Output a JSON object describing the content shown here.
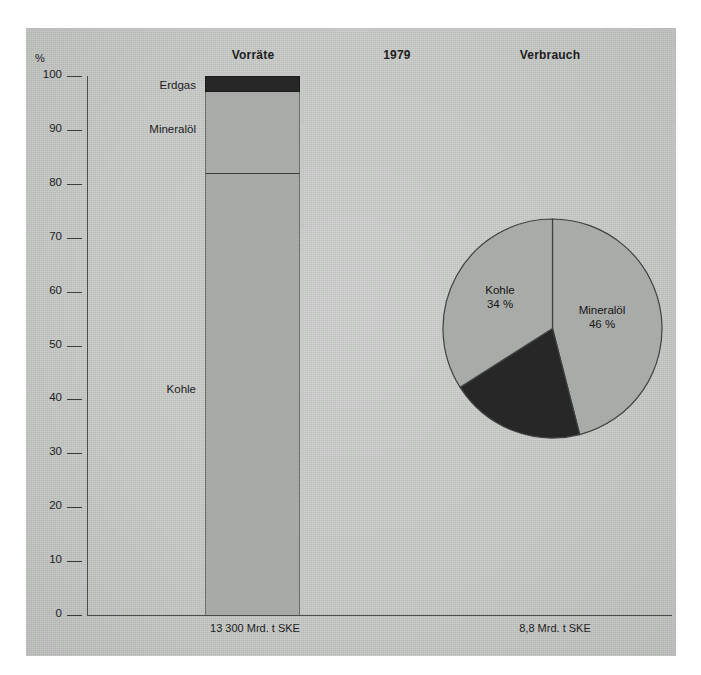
{
  "headers": {
    "reserves": "Vorräte",
    "year": "1979",
    "consumption": "Verbrauch"
  },
  "axis": {
    "unit": "%",
    "ticks": [
      {
        "value": 100,
        "label": "100"
      },
      {
        "value": 90,
        "label": "90"
      },
      {
        "value": 80,
        "label": "80"
      },
      {
        "value": 70,
        "label": "70"
      },
      {
        "value": 60,
        "label": "60"
      },
      {
        "value": 50,
        "label": "50"
      },
      {
        "value": 40,
        "label": "40"
      },
      {
        "value": 30,
        "label": "30"
      },
      {
        "value": 20,
        "label": "20"
      },
      {
        "value": 10,
        "label": "10"
      },
      {
        "value": 0,
        "label": "0"
      }
    ]
  },
  "bar_labels": {
    "erdgas": "Erdgas",
    "mineraloel": "Mineralöl",
    "kohle": "Kohle"
  },
  "pie_labels": {
    "kohle_name": "Kohle",
    "kohle_value": "34 %",
    "mineraloel_name": "Mineralöl",
    "mineraloel_value": "46 %"
  },
  "footnotes": {
    "reserves_total": "13 300 Mrd. t SKE",
    "consumption_total": "8,8 Mrd. t SKE"
  },
  "colors": {
    "panel": "#c9cbc9",
    "light_fill": "#a9aba9",
    "dark_fill": "#272727",
    "outline": "#4a4c4c",
    "text": "#1d1d1d"
  },
  "chart_data": [
    {
      "type": "bar",
      "title": "Vorräte",
      "subtitle": "13 300 Mrd. t SKE",
      "stacked": true,
      "categories": [
        "Vorräte 1979"
      ],
      "series": [
        {
          "name": "Kohle",
          "values": [
            82
          ],
          "color": "#a9aba9"
        },
        {
          "name": "Mineralöl",
          "values": [
            15
          ],
          "color": "#a9aba9"
        },
        {
          "name": "Erdgas",
          "values": [
            3
          ],
          "color": "#272727"
        }
      ],
      "xlabel": "",
      "ylabel": "%",
      "ylim": [
        0,
        100
      ],
      "yticks": [
        0,
        10,
        20,
        30,
        40,
        50,
        60,
        70,
        80,
        90,
        100
      ],
      "grid": false,
      "legend": "inline-labels"
    },
    {
      "type": "pie",
      "title": "Verbrauch",
      "subtitle": "8,8 Mrd. t SKE",
      "categories": [
        "Mineralöl",
        "Erdgas",
        "Kohle"
      ],
      "values": [
        46,
        20,
        34
      ],
      "labels_shown": [
        "Mineralöl 46 %",
        "Kohle 34 %"
      ],
      "colors": [
        "#a9aba9",
        "#272727",
        "#a9aba9"
      ],
      "start_angle_deg": 0,
      "direction": "clockwise",
      "legend": "inline-labels"
    }
  ]
}
